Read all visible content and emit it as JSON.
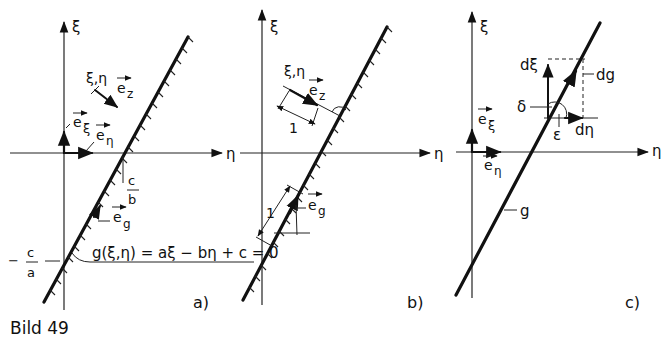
{
  "figure": {
    "caption": "Bild 49",
    "panels": [
      {
        "id": "a",
        "label": "a)",
        "axis_vertical": "ξ",
        "axis_horizontal": "η",
        "point_label": "ξ,η",
        "vector_ez": "e",
        "vector_ez_sub": "z",
        "vector_exi": "e",
        "vector_exi_sub": "ξ",
        "vector_eeta": "e",
        "vector_eeta_sub": "η",
        "vector_eg": "e",
        "vector_eg_sub": "g",
        "intercept_eta_num": "c",
        "intercept_eta_den": "b",
        "intercept_xi_sign": "−",
        "intercept_xi_num": "c",
        "intercept_xi_den": "a",
        "equation": "g(ξ,η) = aξ − bη + c = 0"
      },
      {
        "id": "b",
        "label": "b)",
        "axis_vertical": "ξ",
        "axis_horizontal": "η",
        "point_label": "ξ,η",
        "vector_ez": "e",
        "vector_ez_sub": "z",
        "unit_length_1": "1",
        "unit_length_2": "1",
        "vector_eg": "e",
        "vector_eg_sub": "g"
      },
      {
        "id": "c",
        "label": "c)",
        "axis_vertical": "ξ",
        "axis_horizontal": "η",
        "vector_exi": "e",
        "vector_exi_sub": "ξ",
        "vector_eeta": "e",
        "vector_eeta_sub": "η",
        "d_xi": "dξ",
        "d_g": "dg",
        "d_eta": "dη",
        "angle_delta": "δ",
        "angle_epsilon": "ε",
        "line_label": "g"
      }
    ]
  }
}
